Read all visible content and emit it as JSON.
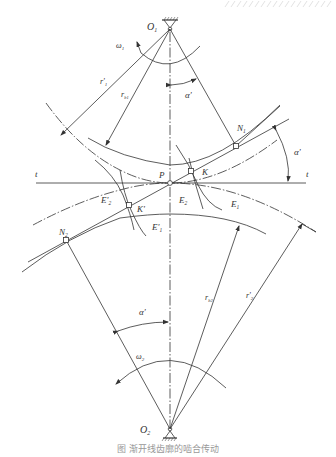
{
  "figure": {
    "caption": "图 渐开线齿廓的啮合传动",
    "labels": {
      "O1": "O",
      "O1_sub": "1",
      "O2": "O",
      "O2_sub": "2",
      "omega1": "ω",
      "omega1_sub": "1",
      "omega2": "ω",
      "omega2_sub": "2",
      "r1_pitch": "r'",
      "r1_pitch_sub": "1",
      "rb1": "r",
      "rb1_sub": "b1",
      "r2_pitch": "r'",
      "r2_pitch_sub": "2",
      "rb2": "r",
      "rb2_sub": "b2",
      "alpha_top": "α'",
      "alpha_right": "α'",
      "alpha_bottom": "α'",
      "N1": "N",
      "N1_sub": "1",
      "N2": "N",
      "N2_sub": "2",
      "P": "P",
      "K": "K",
      "K_prime": "K'",
      "E1": "E",
      "E1_sub": "1",
      "E2": "E",
      "E2_sub": "2",
      "E1_prime": "E'",
      "E1_prime_sub": "1",
      "E2_prime": "E'",
      "E2_prime_sub": "2",
      "t_left": "t",
      "t_right": "t"
    },
    "colors": {
      "line": "#333333",
      "background": "#ffffff"
    }
  }
}
